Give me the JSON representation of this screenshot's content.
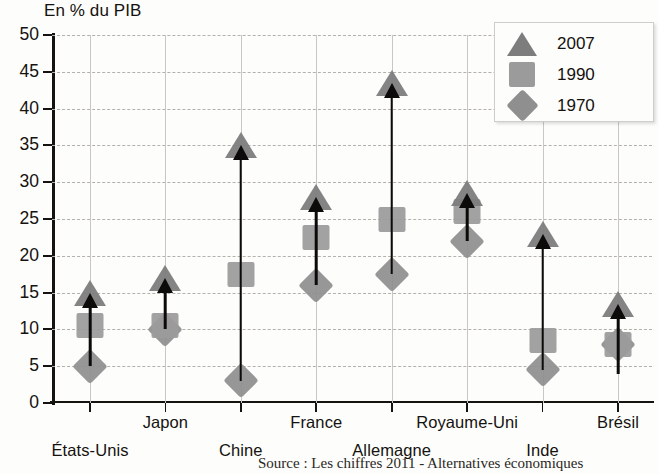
{
  "chart_data": {
    "type": "scatter",
    "title": "En % du PIB",
    "ylabel": "En % du PIB",
    "xlabel": "",
    "ylim": [
      0,
      50
    ],
    "yticks": [
      0,
      5,
      10,
      15,
      20,
      25,
      30,
      35,
      40,
      45,
      50
    ],
    "grid": true,
    "legend_position": "top-right",
    "categories": [
      "États-Unis",
      "Japon",
      "Chine",
      "France",
      "Allemagne",
      "Royaume-Uni",
      "Inde",
      "Brésil"
    ],
    "series": [
      {
        "name": "1970",
        "marker": "diamond",
        "color": "#8f8f8f",
        "values": [
          5,
          10,
          3,
          16,
          17.5,
          22,
          4.5,
          8
        ]
      },
      {
        "name": "1990",
        "marker": "square",
        "color": "#9b9b9b",
        "values": [
          10.5,
          10.5,
          17.5,
          22.5,
          25,
          26,
          8.5,
          8
        ]
      },
      {
        "name": "2007",
        "marker": "triangle",
        "color": "#7d7d7d",
        "values": [
          15,
          17,
          35,
          28,
          43.5,
          28.5,
          23,
          13.5
        ]
      }
    ],
    "annotations": [
      {
        "type": "arrow",
        "category": "États-Unis",
        "from": 5,
        "to": 15
      },
      {
        "type": "arrow",
        "category": "Japon",
        "from": 10,
        "to": 17
      },
      {
        "type": "arrow",
        "category": "Chine",
        "from": 3,
        "to": 35
      },
      {
        "type": "arrow",
        "category": "France",
        "from": 16,
        "to": 28
      },
      {
        "type": "arrow",
        "category": "Allemagne",
        "from": 17.5,
        "to": 43.5
      },
      {
        "type": "arrow",
        "category": "Royaume-Uni",
        "from": 22,
        "to": 28.5
      },
      {
        "type": "arrow",
        "category": "Inde",
        "from": 4.5,
        "to": 23
      },
      {
        "type": "arrow",
        "category": "Brésil",
        "from": 4,
        "to": 13.5
      }
    ]
  },
  "axis": {
    "title": "En % du PIB",
    "y_tick_labels": [
      "50",
      "45",
      "40",
      "35",
      "30",
      "25",
      "20",
      "15",
      "10",
      "5",
      "0"
    ]
  },
  "x_labels": [
    {
      "text": "États-Unis",
      "row": 1
    },
    {
      "text": "Japon",
      "row": 0
    },
    {
      "text": "Chine",
      "row": 1
    },
    {
      "text": "France",
      "row": 0
    },
    {
      "text": "Allemagne",
      "row": 1
    },
    {
      "text": "Royaume-Uni",
      "row": 0
    },
    {
      "text": "Inde",
      "row": 1
    },
    {
      "text": "Brésil",
      "row": 0
    }
  ],
  "legend": {
    "entries": [
      {
        "label": "2007",
        "marker": "triangle"
      },
      {
        "label": "1990",
        "marker": "square"
      },
      {
        "label": "1970",
        "marker": "diamond"
      }
    ]
  },
  "source_note": "Source : Les chiffres 2011 - Alternatives économiques"
}
